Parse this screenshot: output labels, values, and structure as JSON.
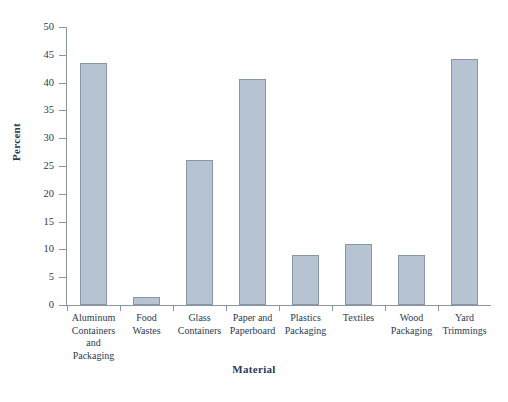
{
  "chart_data": {
    "type": "bar",
    "title": "",
    "xlabel": "Material",
    "ylabel": "Percent",
    "categories": [
      "Aluminum Containers and Packaging",
      "Food Wastes",
      "Glass Containers",
      "Paper and Paperboard",
      "Plastics Packaging",
      "Textiles",
      "Wood Packaging",
      "Yard Trimmings"
    ],
    "category_lines": [
      [
        "Aluminum",
        "Containers",
        "and",
        "Packaging"
      ],
      [
        "Food",
        "Wastes"
      ],
      [
        "Glass",
        "Containers"
      ],
      [
        "Paper and",
        "Paperboard"
      ],
      [
        "Plastics",
        "Packaging"
      ],
      [
        "Textiles"
      ],
      [
        "Wood",
        "Packaging"
      ],
      [
        "Yard",
        "Trimmings"
      ]
    ],
    "values": [
      43.5,
      1.4,
      26.0,
      40.7,
      9.0,
      11.0,
      9.0,
      44.2
    ],
    "ylim": [
      0,
      50
    ],
    "yticks": [
      0,
      5,
      10,
      15,
      20,
      25,
      30,
      35,
      40,
      45,
      50
    ],
    "ytick_labels": [
      "0",
      "5",
      "10",
      "15",
      "20",
      "25",
      "30",
      "35",
      "40",
      "45",
      "50"
    ],
    "grid": false,
    "legend": false,
    "bar_fill_color": "#b6c3d2",
    "bar_border_color": "#8896aa",
    "axis_color": "#8a94a6",
    "text_color": "#2b3a52",
    "background_color": "#ffffff"
  }
}
